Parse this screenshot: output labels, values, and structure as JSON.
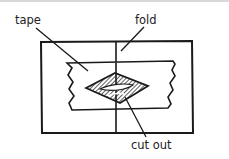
{
  "diagram": {
    "type": "labeled-illustration",
    "labels": {
      "tape": "tape",
      "fold": "fold",
      "cut_out": "cut out"
    },
    "colors": {
      "ink": "#1a1a1a",
      "background": "#ffffff",
      "border": "#d8d8d8"
    }
  }
}
